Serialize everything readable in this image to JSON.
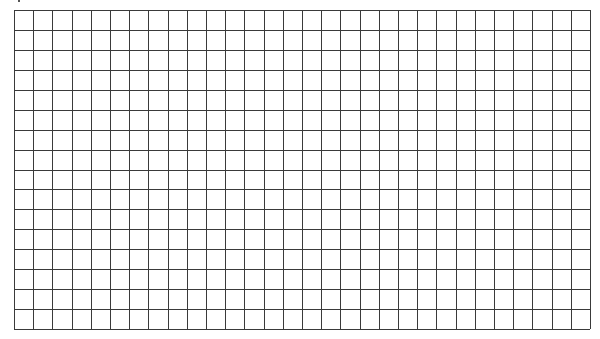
{
  "grid": {
    "columns": 30,
    "rows": 16,
    "origin_x": 14,
    "origin_y": 10,
    "width": 576,
    "height": 319,
    "line_color": "#3a3a3a",
    "line_width": 1,
    "background": "#ffffff"
  },
  "marks": [
    {
      "name": "clipped-glyph-fragment",
      "x": 18,
      "y": 0
    }
  ]
}
